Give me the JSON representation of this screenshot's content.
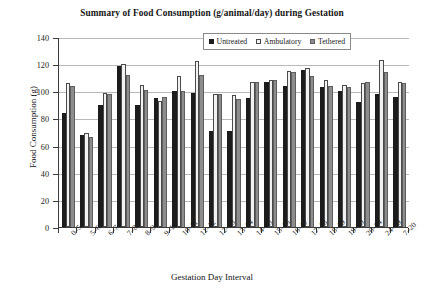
{
  "chart_data": {
    "type": "bar",
    "title": "Summary of Food Consumption (g/animal/day) during Gestation",
    "xlabel": "Gestation Day Interval",
    "ylabel": "Food Consumption (g)",
    "ylim": [
      0,
      140
    ],
    "yticks": [
      0,
      20,
      40,
      60,
      80,
      100,
      120,
      140
    ],
    "grid": true,
    "legend_position": "top-center",
    "categories": [
      "0–5",
      "5–6",
      "6–7",
      "7–8",
      "8–9",
      "9–10",
      "10–11",
      "11–12",
      "12–13",
      "13–14",
      "14–15",
      "15–16",
      "16–17",
      "17–18",
      "18–19",
      "19–20",
      "20–24",
      "24–29",
      "7–20"
    ],
    "series": [
      {
        "name": "Untreated",
        "color": "#1c1c1c",
        "values": [
          84,
          68,
          90,
          119,
          90,
          95,
          100,
          99,
          71,
          71,
          95,
          107,
          104,
          116,
          103,
          100,
          92,
          98,
          96
        ]
      },
      {
        "name": "Ambulatory",
        "color": "#f2f2f2",
        "values": [
          106,
          69,
          99,
          120,
          105,
          93,
          111,
          122,
          98,
          97,
          107,
          108,
          115,
          117,
          108,
          105,
          106,
          123,
          107
        ]
      },
      {
        "name": "Tethered",
        "color": "#8d8d8d",
        "values": [
          104,
          66,
          98,
          112,
          101,
          96,
          100,
          112,
          98,
          94,
          107,
          108,
          114,
          111,
          104,
          103,
          107,
          114,
          106
        ]
      }
    ]
  }
}
